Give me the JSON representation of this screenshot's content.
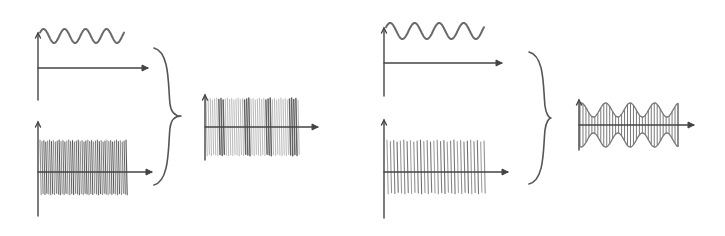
{
  "diagram": {
    "title": "",
    "panels": [
      {
        "id": "fm",
        "description": "Frequency modulation: message sine + high-frequency carrier combine into frequency-modulated signal",
        "message": {
          "axis": {
            "x0": 38,
            "y0": 100,
            "yTop": 33,
            "xAxisY": 68,
            "xEnd": 148
          },
          "wave": {
            "x0": 40,
            "x1": 124,
            "cy": 36,
            "amp": 7,
            "cycles": 4
          }
        },
        "carrier": {
          "axis": {
            "x0": 38,
            "y0": 216,
            "yTop": 122,
            "xAxisY": 172,
            "xEnd": 152
          },
          "lines": {
            "x0": 40,
            "x1": 126,
            "yTop": 141,
            "yBot": 194,
            "count": 46,
            "color": "#3a3a3a"
          }
        },
        "brace": {
          "x": 160,
          "yTop": 48,
          "yBot": 185,
          "tipX": 181,
          "mid": 116
        },
        "result": {
          "axis": {
            "x0": 205,
            "y0": 160,
            "yTop": 95,
            "xAxisY": 127,
            "xEnd": 318
          },
          "lines": {
            "x0": 206,
            "x1": 298,
            "yTop": 99,
            "yBot": 155,
            "count": 44,
            "color": "#5a5a5a",
            "dense_bands": [
              [
                218,
                225
              ],
              [
                243,
                250
              ],
              [
                265,
                272
              ],
              [
                289,
                296
              ]
            ]
          }
        }
      },
      {
        "id": "am",
        "description": "Amplitude modulation: message sine + carrier combine into amplitude-modulated signal with envelope",
        "message": {
          "axis": {
            "x0": 384,
            "y0": 96,
            "yTop": 28,
            "xAxisY": 63,
            "xEnd": 502
          },
          "wave": {
            "x0": 386,
            "x1": 484,
            "cy": 31,
            "amp": 8,
            "cycles": 4
          }
        },
        "carrier": {
          "axis": {
            "x0": 384,
            "y0": 218,
            "yTop": 120,
            "xAxisY": 172,
            "xEnd": 508
          },
          "lines": {
            "x0": 387,
            "x1": 484,
            "yTop": 141,
            "yBot": 193,
            "count": 30,
            "color": "#555555"
          }
        },
        "brace": {
          "x": 535,
          "yTop": 52,
          "yBot": 184,
          "tipX": 551,
          "mid": 118
        },
        "result": {
          "axis": {
            "x0": 579,
            "y0": 150,
            "yTop": 100,
            "xAxisY": 125,
            "xEnd": 694
          },
          "envelope": {
            "x0": 580,
            "x1": 678,
            "cy": 125,
            "ampMax": 22,
            "ampMin": 8,
            "cycles": 4
          },
          "lines": {
            "count": 34,
            "color": "#6a6a6a"
          }
        }
      }
    ]
  },
  "colors": {
    "background": "#ffffff",
    "ink": "#444444",
    "wave": "#6a6a6a"
  }
}
